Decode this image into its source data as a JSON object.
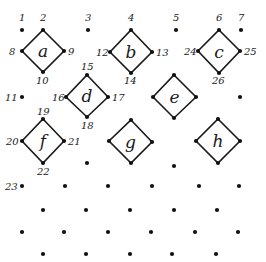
{
  "diagram": {
    "width": 266,
    "height": 262,
    "colors": {
      "ink": "#1a1a1a",
      "background": "#ffffff"
    },
    "squares": [
      {
        "letter": "a",
        "top": [
          43,
          30
        ],
        "left": [
          22,
          51
        ],
        "right": [
          64,
          51
        ],
        "bottom": [
          43,
          72
        ]
      },
      {
        "letter": "b",
        "top": [
          131,
          30
        ],
        "left": [
          110,
          52
        ],
        "right": [
          152,
          52
        ],
        "bottom": [
          131,
          73
        ]
      },
      {
        "letter": "c",
        "top": [
          219,
          30
        ],
        "left": [
          198,
          51
        ],
        "right": [
          240,
          51
        ],
        "bottom": [
          219,
          73
        ]
      },
      {
        "letter": "d",
        "top": [
          87,
          75
        ],
        "left": [
          66,
          97
        ],
        "right": [
          108,
          97
        ],
        "bottom": [
          87,
          117
        ]
      },
      {
        "letter": "e",
        "top": [
          174,
          75
        ],
        "left": [
          153,
          97
        ],
        "right": [
          196,
          97
        ],
        "bottom": [
          174,
          118
        ]
      },
      {
        "letter": "f",
        "top": [
          43,
          119
        ],
        "left": [
          22,
          141
        ],
        "right": [
          64,
          141
        ],
        "bottom": [
          43,
          163
        ]
      },
      {
        "letter": "g",
        "top": [
          131,
          120
        ],
        "left": [
          109,
          141
        ],
        "right": [
          152,
          142
        ],
        "bottom": [
          131,
          163
        ]
      },
      {
        "letter": "h",
        "top": [
          218,
          119
        ],
        "left": [
          196,
          141
        ],
        "right": [
          240,
          141
        ],
        "bottom": [
          218,
          163
        ]
      }
    ],
    "labels": [
      {
        "text": "1",
        "x": 19,
        "y": 21
      },
      {
        "text": "2",
        "x": 40,
        "y": 21
      },
      {
        "text": "3",
        "x": 85,
        "y": 21
      },
      {
        "text": "4",
        "x": 128,
        "y": 21
      },
      {
        "text": "5",
        "x": 173,
        "y": 21
      },
      {
        "text": "6",
        "x": 216,
        "y": 21
      },
      {
        "text": "7",
        "x": 238,
        "y": 21
      },
      {
        "text": "8",
        "x": 9,
        "y": 55
      },
      {
        "text": "9",
        "x": 68,
        "y": 55
      },
      {
        "text": "10",
        "x": 36,
        "y": 84
      },
      {
        "text": "11",
        "x": 5,
        "y": 101
      },
      {
        "text": "12",
        "x": 96,
        "y": 56
      },
      {
        "text": "13",
        "x": 156,
        "y": 56
      },
      {
        "text": "14",
        "x": 124,
        "y": 84
      },
      {
        "text": "15",
        "x": 81,
        "y": 70
      },
      {
        "text": "16",
        "x": 52,
        "y": 101
      },
      {
        "text": "17",
        "x": 112,
        "y": 101
      },
      {
        "text": "18",
        "x": 81,
        "y": 129
      },
      {
        "text": "19",
        "x": 37,
        "y": 115
      },
      {
        "text": "20",
        "x": 6,
        "y": 145
      },
      {
        "text": "21",
        "x": 68,
        "y": 145
      },
      {
        "text": "22",
        "x": 37,
        "y": 175
      },
      {
        "text": "23",
        "x": 5,
        "y": 190
      },
      {
        "text": "24",
        "x": 184,
        "y": 55
      },
      {
        "text": "25",
        "x": 244,
        "y": 55
      },
      {
        "text": "26",
        "x": 212,
        "y": 84
      }
    ],
    "loose_dots": [
      [
        22,
        30
      ],
      [
        88,
        30
      ],
      [
        176,
        30
      ],
      [
        241,
        30
      ],
      [
        22,
        97
      ],
      [
        240,
        97
      ],
      [
        87,
        163
      ],
      [
        174,
        166
      ],
      [
        22,
        186
      ],
      [
        65,
        186
      ],
      [
        108,
        186
      ],
      [
        152,
        186
      ],
      [
        199,
        186
      ],
      [
        239,
        186
      ],
      [
        43,
        210
      ],
      [
        86,
        210
      ],
      [
        130,
        210
      ],
      [
        174,
        210
      ],
      [
        217,
        210
      ],
      [
        22,
        232
      ],
      [
        64,
        232
      ],
      [
        108,
        232
      ],
      [
        151,
        232
      ],
      [
        195,
        232
      ],
      [
        238,
        232
      ],
      [
        43,
        254
      ],
      [
        86,
        254
      ],
      [
        130,
        254
      ],
      [
        172,
        254
      ],
      [
        216,
        254
      ]
    ]
  }
}
